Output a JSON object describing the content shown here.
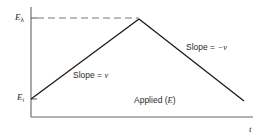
{
  "diagram": {
    "y_axis": {
      "labels": {
        "upper": {
          "main": "E",
          "sub": "λ"
        },
        "lower": {
          "main": "E",
          "sub": "i"
        }
      }
    },
    "x_axis": {
      "label": "t"
    },
    "annotations": {
      "rising_slope": {
        "prefix": "Slope = ",
        "symbol": "v"
      },
      "falling_slope": {
        "prefix": "Slope = ",
        "symbol": "−v"
      },
      "curve_label": {
        "prefix": "Applied (",
        "symbol": "E",
        "suffix": ")"
      }
    },
    "colors": {
      "line": "#1a1a1a",
      "axis": "#555555",
      "dashed": "#777777",
      "text": "#2a2a2a",
      "background": "#ffffff"
    }
  }
}
